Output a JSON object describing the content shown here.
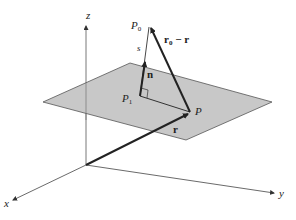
{
  "figure": {
    "type": "3d-vector-diagram",
    "axes": {
      "x": {
        "label": "x"
      },
      "y": {
        "label": "y"
      },
      "z": {
        "label": "z"
      }
    },
    "labels": {
      "P0": "P",
      "P0_sub": "0",
      "P1": "P",
      "P1_sub": "1",
      "P": "P",
      "s": "s",
      "n": "n",
      "r": "r",
      "r0_minus_r_main": "r",
      "r0_minus_r_sub": "0",
      "r0_minus_r_rest": " − r"
    },
    "colors": {
      "plane_fill": "#c8c8c8",
      "plane_stroke": "#555555",
      "axis": "#444444",
      "vector": "#2a2a2a"
    }
  }
}
